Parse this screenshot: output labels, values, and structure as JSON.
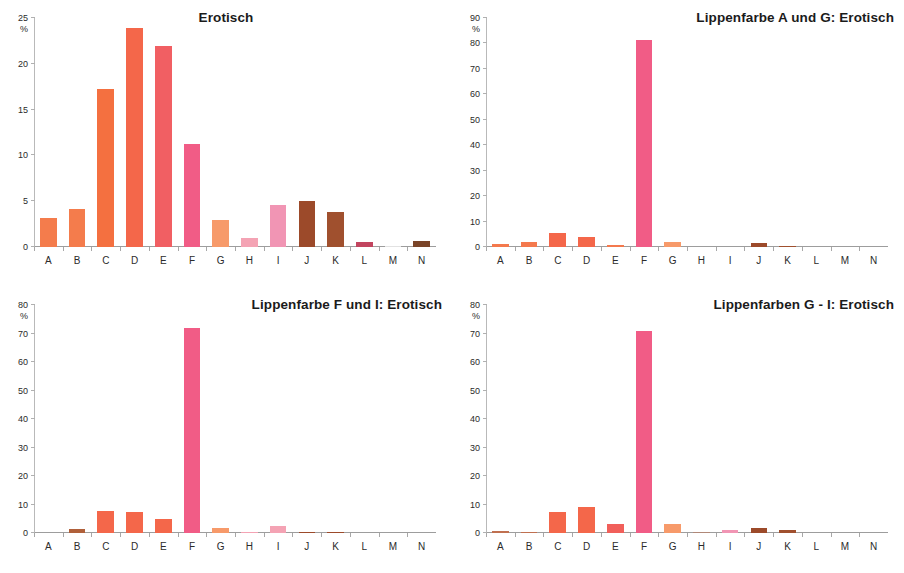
{
  "chart_data": [
    {
      "type": "bar",
      "panel": "top-left",
      "title": "Erotisch",
      "title_align": "center",
      "categories": [
        "A",
        "B",
        "C",
        "D",
        "E",
        "F",
        "G",
        "H",
        "I",
        "J",
        "K",
        "L",
        "M",
        "N"
      ],
      "values": [
        3.2,
        4.2,
        17.3,
        23.9,
        21.9,
        11.3,
        2.9,
        1.0,
        4.6,
        5.0,
        3.8,
        0.6,
        0.15,
        0.65
      ],
      "colors": [
        "#F47C4C",
        "#F47C4C",
        "#F47040",
        "#F4674A",
        "#F15F63",
        "#F15C86",
        "#F79A6A",
        "#F4A3B4",
        "#F195B4",
        "#9C4A2A",
        "#A0502E",
        "#C2455F",
        "#E2E2E2",
        "#7A4428"
      ],
      "ylabel": "%",
      "ylim": [
        0,
        25
      ],
      "yticks": [
        0,
        5,
        10,
        15,
        20,
        25
      ],
      "xlabel": "",
      "grid": false,
      "legend": false
    },
    {
      "type": "bar",
      "panel": "top-right",
      "title": "Lippenfarbe A und G: Erotisch",
      "title_align": "right",
      "categories": [
        "A",
        "B",
        "C",
        "D",
        "E",
        "F",
        "G",
        "H",
        "I",
        "J",
        "K",
        "L",
        "M",
        "N"
      ],
      "values": [
        1.2,
        1.9,
        5.4,
        4.1,
        0.6,
        81.5,
        2.1,
        0.0,
        0.0,
        1.4,
        0.5,
        0.0,
        0.0,
        0.0
      ],
      "colors": [
        "#F4794D",
        "#F4794D",
        "#F4674A",
        "#F4674A",
        "#F4794D",
        "#F15C86",
        "#F79A6A",
        "#DDDDDD",
        "#DDDDDD",
        "#9C4A2A",
        "#A0502E",
        "#DDDDDD",
        "#DDDDDD",
        "#DDDDDD"
      ],
      "ylabel": "%",
      "ylim": [
        0,
        90
      ],
      "yticks": [
        0,
        10,
        20,
        30,
        40,
        50,
        60,
        70,
        80,
        90
      ],
      "xlabel": "",
      "grid": false,
      "legend": false
    },
    {
      "type": "bar",
      "panel": "bottom-left",
      "title": "Lippenfarbe F und I: Erotisch",
      "title_align": "right",
      "categories": [
        "A",
        "B",
        "C",
        "D",
        "E",
        "F",
        "G",
        "H",
        "I",
        "J",
        "K",
        "L",
        "M",
        "N"
      ],
      "values": [
        0.0,
        1.3,
        7.9,
        7.3,
        4.8,
        71.8,
        1.8,
        0.3,
        2.6,
        0.5,
        0.4,
        0.0,
        0.0,
        0.0
      ],
      "colors": [
        "#DDDDDD",
        "#B0603A",
        "#F4674A",
        "#F4674A",
        "#F4674A",
        "#F15C86",
        "#F79A6A",
        "#F4A3B4",
        "#F4A3B4",
        "#9C4A2A",
        "#9C4A2A",
        "#DDDDDD",
        "#DDDDDD",
        "#DDDDDD"
      ],
      "ylabel": "%",
      "ylim": [
        0,
        80
      ],
      "yticks": [
        0,
        10,
        20,
        30,
        40,
        50,
        60,
        70,
        80
      ],
      "xlabel": "",
      "grid": false,
      "legend": false
    },
    {
      "type": "bar",
      "panel": "bottom-right",
      "title": "Lippenfarben G - I: Erotisch",
      "title_align": "right",
      "categories": [
        "A",
        "B",
        "C",
        "D",
        "E",
        "F",
        "G",
        "H",
        "I",
        "J",
        "K",
        "L",
        "M",
        "N"
      ],
      "values": [
        0.6,
        0.5,
        7.4,
        9.2,
        3.2,
        70.9,
        3.3,
        0.3,
        1.2,
        1.8,
        1.2,
        0.0,
        0.0,
        0.0
      ],
      "colors": [
        "#C07050",
        "#C07050",
        "#F4674A",
        "#F4674A",
        "#F15F5A",
        "#F15C86",
        "#F79A6A",
        "#B08878",
        "#F195B4",
        "#9C4A2A",
        "#A0502E",
        "#DDDDDD",
        "#DDDDDD",
        "#DDDDDD"
      ],
      "ylabel": "%",
      "ylim": [
        0,
        80
      ],
      "yticks": [
        0,
        10,
        20,
        30,
        40,
        50,
        60,
        70,
        80
      ],
      "xlabel": "",
      "grid": false,
      "legend": false
    }
  ]
}
